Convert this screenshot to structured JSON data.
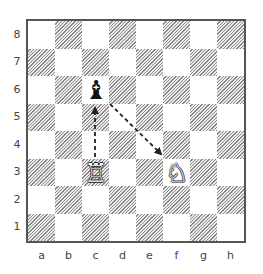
{
  "board": {
    "files": [
      "a",
      "b",
      "c",
      "d",
      "e",
      "f",
      "g",
      "h"
    ],
    "ranks": [
      "8",
      "7",
      "6",
      "5",
      "4",
      "3",
      "2",
      "1"
    ],
    "border_color": "#555555",
    "light_square_color": "#ffffff",
    "dark_square_style": "diagonal hatch"
  },
  "pieces": [
    {
      "square": "c6",
      "color": "black",
      "type": "bishop",
      "glyph": "♝"
    },
    {
      "square": "c3",
      "color": "white",
      "type": "rook",
      "glyph": "♖"
    },
    {
      "square": "f3",
      "color": "white",
      "type": "knight",
      "glyph": "♘"
    }
  ],
  "arrows": [
    {
      "from": "c3",
      "to": "c6",
      "style": "dashed",
      "direction": "rook-to-bishop"
    },
    {
      "from": "c6",
      "to": "f3",
      "style": "dashed",
      "direction": "bishop-to-knight"
    }
  ]
}
